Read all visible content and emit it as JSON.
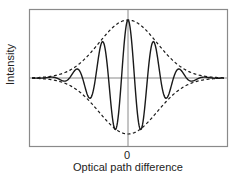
{
  "chart_data": {
    "type": "line",
    "title": "",
    "xlabel": "Optical path difference",
    "ylabel": "Intensity",
    "x_ticks": [
      "0"
    ],
    "grid": false,
    "legend": "none",
    "series": [
      {
        "name": "interferogram",
        "style": "solid",
        "description": "cosine fringes under Gaussian envelope, central maximum at zero path difference",
        "relative_peaks": [
          {
            "x": 0,
            "y": 1.0
          },
          {
            "x": -1,
            "y": 0.62
          },
          {
            "x": 1,
            "y": 0.62
          },
          {
            "x": -2,
            "y": 0.15
          },
          {
            "x": 2,
            "y": 0.15
          }
        ],
        "relative_troughs": [
          {
            "x": -0.5,
            "y": -0.86
          },
          {
            "x": 0.5,
            "y": -0.86
          },
          {
            "x": -1.5,
            "y": -0.34
          },
          {
            "x": 1.5,
            "y": -0.34
          }
        ]
      },
      {
        "name": "upper envelope",
        "style": "dashed",
        "description": "Gaussian envelope, max 1.0 at x=0"
      },
      {
        "name": "lower envelope",
        "style": "dashed",
        "description": "mirrored Gaussian envelope, min -1.0 at x=0"
      }
    ]
  },
  "labels": {
    "ylabel": "Intensity",
    "xlabel": "Optical path difference",
    "tick_zero": "0"
  },
  "colors": {
    "frame": "#8a8a8a",
    "curve": "#1a1a1a",
    "text": "#222222"
  }
}
